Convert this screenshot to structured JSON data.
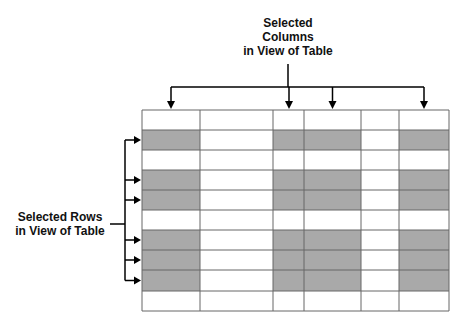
{
  "labels": {
    "columns_line1": "Selected",
    "columns_line2": "Columns",
    "columns_line3": "in View of Table",
    "rows_line1": "Selected Rows",
    "rows_line2": "in View of Table"
  },
  "table": {
    "col_edges": [
      142,
      200,
      273,
      304,
      361,
      399,
      449
    ],
    "row_edges": [
      110,
      130,
      150,
      170,
      190,
      210,
      230,
      250,
      270,
      291,
      311
    ],
    "selected_columns": [
      0,
      2,
      3,
      5
    ],
    "selected_rows": [
      1,
      3,
      4,
      6,
      7,
      8
    ],
    "shade_color": "#a9a9a9",
    "line_color": "#666666"
  }
}
